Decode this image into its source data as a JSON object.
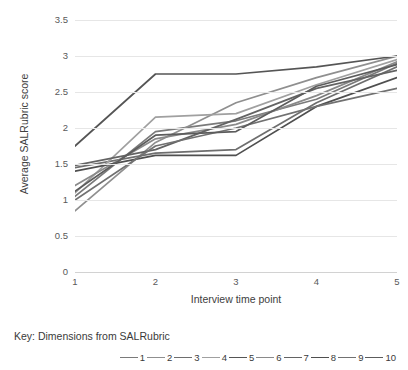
{
  "chart_data": {
    "type": "line",
    "title": "",
    "xlabel": "Interview time point",
    "ylabel": "Average SALRubric score",
    "x": [
      1,
      2,
      3,
      4,
      5
    ],
    "xtick_labels": [
      "1",
      "2",
      "3",
      "4",
      "5"
    ],
    "ytick_labels": [
      "0",
      "0.5",
      "1",
      "1.5",
      "2",
      "2.5",
      "3",
      "3.5"
    ],
    "ytick_values": [
      0,
      0.5,
      1,
      1.5,
      2,
      2.5,
      3,
      3.5
    ],
    "ylim": [
      0,
      3.5
    ],
    "xlim": [
      1,
      5
    ],
    "grid": true,
    "grid_axis": "y",
    "legend_position": "bottom",
    "legend_title": "Key: Dimensions from SALRubric",
    "series": [
      {
        "name": "1",
        "color": "#7a7a7a",
        "values": [
          1.05,
          1.95,
          2.1,
          2.4,
          2.9
        ]
      },
      {
        "name": "2",
        "color": "#8f8f8f",
        "values": [
          0.85,
          1.8,
          2.35,
          2.7,
          3.0
        ]
      },
      {
        "name": "3",
        "color": "#6e6e6e",
        "values": [
          1.45,
          1.65,
          1.7,
          2.35,
          2.85
        ]
      },
      {
        "name": "4",
        "color": "#a0a0a0",
        "values": [
          1.1,
          2.15,
          2.2,
          2.6,
          2.95
        ]
      },
      {
        "name": "5",
        "color": "#555555",
        "values": [
          1.75,
          2.75,
          2.75,
          2.85,
          3.0
        ]
      },
      {
        "name": "6",
        "color": "#8a8a8a",
        "values": [
          1.2,
          1.85,
          2.05,
          2.45,
          2.92
        ]
      },
      {
        "name": "7",
        "color": "#636363",
        "values": [
          1.48,
          1.7,
          2.12,
          2.55,
          2.8
        ]
      },
      {
        "name": "8",
        "color": "#4f4f4f",
        "values": [
          1.4,
          1.62,
          1.62,
          2.3,
          2.7
        ]
      },
      {
        "name": "9",
        "color": "#717171",
        "values": [
          1.0,
          1.75,
          2.0,
          2.3,
          2.55
        ]
      },
      {
        "name": "10",
        "color": "#5c5c5c",
        "values": [
          1.12,
          1.9,
          1.95,
          2.58,
          2.88
        ]
      }
    ]
  }
}
